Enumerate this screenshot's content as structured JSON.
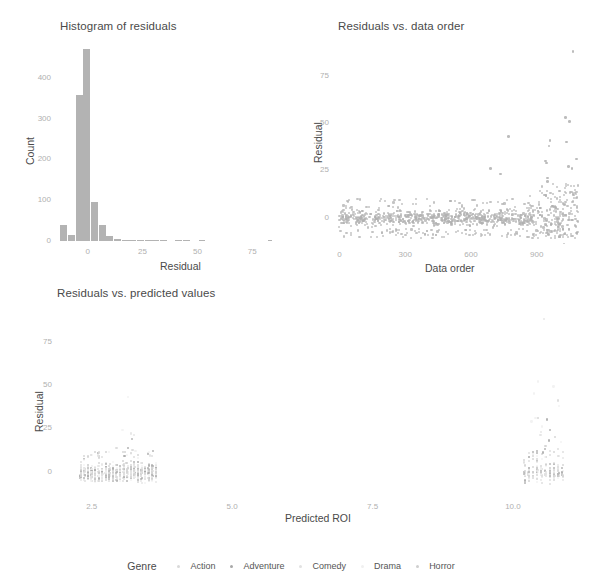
{
  "figure": {
    "background": "#ffffff",
    "point_color": "#b0b0b0",
    "bar_color": "#b3b3b3",
    "axis_text_color": "#b0b0b0",
    "title_color": "#4a4a4a"
  },
  "legend": {
    "title": "Genre",
    "entries": [
      {
        "label": "Action",
        "color": "#d9d9d9"
      },
      {
        "label": "Adventure",
        "color": "#a8a8a8"
      },
      {
        "label": "Comedy",
        "color": "#e2e2e2"
      },
      {
        "label": "Drama",
        "color": "#f0f0f0"
      },
      {
        "label": "Horror",
        "color": "#cfcfcf"
      }
    ]
  },
  "chart_data": [
    {
      "id": "histogram-of-residuals",
      "type": "bar",
      "title": "Histogram of residuals",
      "xlabel": "Residual",
      "ylabel": "Count",
      "xlim": [
        -14,
        84
      ],
      "ylim": [
        0,
        480
      ],
      "xticks": [
        0,
        25,
        50,
        75
      ],
      "xtick_labels": [
        "0",
        "25",
        "50",
        "75"
      ],
      "yticks": [
        0,
        100,
        200,
        300,
        400
      ],
      "ytick_labels": [
        "0",
        "100",
        "200",
        "300",
        "400"
      ],
      "grid": false,
      "bin_width": 3.5,
      "bin_starts": [
        -12.5,
        -9.0,
        -5.5,
        -2.0,
        1.5,
        5.0,
        8.5,
        12.0,
        15.5,
        19.0,
        22.5,
        26.0,
        29.5,
        33.0,
        36.5,
        40.0,
        43.5,
        47.0,
        50.5,
        54.0,
        57.5,
        61.0,
        64.5,
        68.0,
        71.5,
        75.0,
        78.5,
        82.0
      ],
      "categories": [
        "-12.5",
        "-9",
        "-5.5",
        "-2",
        "1.5",
        "5",
        "8.5",
        "12",
        "15.5",
        "19",
        "22.5",
        "26",
        "29.5",
        "33",
        "36.5",
        "40",
        "43.5",
        "47",
        "50.5",
        "54",
        "57.5",
        "61",
        "64.5",
        "68",
        "71.5",
        "75",
        "78.5",
        "82"
      ],
      "values": [
        38,
        14,
        358,
        470,
        95,
        38,
        13,
        4,
        3,
        2,
        2,
        1,
        1,
        1,
        0,
        1,
        1,
        0,
        1,
        0,
        0,
        0,
        0,
        0,
        0,
        0,
        0,
        1
      ]
    },
    {
      "id": "residuals-vs-data-order",
      "type": "scatter",
      "title": "Residuals vs. data order",
      "xlabel": "Data order",
      "ylabel": "Residual",
      "xlim": [
        -20,
        1120
      ],
      "ylim": [
        -14,
        92
      ],
      "xticks": [
        0,
        300,
        600,
        900
      ],
      "xtick_labels": [
        "0",
        "300",
        "600",
        "900"
      ],
      "yticks": [
        0,
        25,
        50,
        75
      ],
      "ytick_labels": [
        "0",
        "25",
        "50",
        "75"
      ],
      "grid": false,
      "n_points": 1080,
      "notes": "Dense horizontal band of residuals near 0 across all data order; variance increases for data order above ~850 with positive outliers up to ~88.",
      "outliers": [
        {
          "x": 1065,
          "y": 88
        },
        {
          "x": 1030,
          "y": 53
        },
        {
          "x": 1050,
          "y": 51
        },
        {
          "x": 960,
          "y": 41
        },
        {
          "x": 1035,
          "y": 40
        },
        {
          "x": 770,
          "y": 43
        },
        {
          "x": 955,
          "y": 38
        },
        {
          "x": 940,
          "y": 30
        },
        {
          "x": 945,
          "y": 29
        },
        {
          "x": 1080,
          "y": 31
        },
        {
          "x": 1045,
          "y": 27
        },
        {
          "x": 1060,
          "y": 26
        },
        {
          "x": 690,
          "y": 26
        },
        {
          "x": 735,
          "y": 23
        },
        {
          "x": 950,
          "y": 21
        },
        {
          "x": 948,
          "y": 19
        },
        {
          "x": 1005,
          "y": 14
        },
        {
          "x": 1075,
          "y": 13
        },
        {
          "x": 1068,
          "y": 12
        },
        {
          "x": 935,
          "y": 12
        }
      ]
    },
    {
      "id": "residuals-vs-predicted-values",
      "type": "scatter",
      "title": "Residuals vs. predicted values",
      "xlabel": "Predicted ROI",
      "ylabel": "Residual",
      "xlim": [
        1.9,
        11.3
      ],
      "ylim": [
        -14,
        92
      ],
      "xticks": [
        2.5,
        5.0,
        7.5,
        10.0
      ],
      "xtick_labels": [
        "2.5",
        "5.0",
        "7.5",
        "10.0"
      ],
      "yticks": [
        0,
        25,
        50,
        75
      ],
      "ytick_labels": [
        "0",
        "25",
        "50",
        "75"
      ],
      "grid": false,
      "colored_by": "Genre",
      "notes": "Two clusters: a wide low-ROI cluster around 2.4-3.6 with residuals mostly -6 to +12, and a narrow high-ROI cluster near 10.3-10.9 with residuals spreading from -6 up to ~88.",
      "cluster_left": {
        "x_range": [
          2.3,
          3.7
        ],
        "y_range": [
          -7,
          12
        ],
        "max_outlier_y": 43
      },
      "cluster_right": {
        "x_range": [
          10.2,
          10.95
        ],
        "y_range": [
          -7,
          25
        ],
        "max_outlier_y": 88
      }
    }
  ]
}
